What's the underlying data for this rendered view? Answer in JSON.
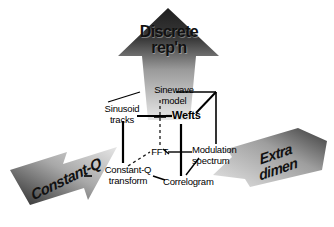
{
  "figure": {
    "background_color": "#ffffff",
    "title_arrow_up": {
      "label": "Discrete\nrep'n",
      "direction": "up",
      "gradient_dark": "#262626",
      "gradient_light": "#e2e2e2"
    },
    "arrow_left": {
      "label": "Constant-Q",
      "direction": "down-left",
      "gradient_dark": "#2b2b2b",
      "gradient_light": "#dadada"
    },
    "arrow_right": {
      "label": "Extra\ndimen",
      "direction": "down-left",
      "gradient_dark": "#2f2f2f",
      "gradient_light": "#dcdcdc"
    }
  },
  "nodes": [
    {
      "id": "sinewave-model",
      "label": "Sinewave\nmodel",
      "bold": false,
      "x": 141,
      "y": 85,
      "w": 66
    },
    {
      "id": "sinusoid-tracks",
      "label": "Sinusoid\ntracks",
      "bold": false,
      "x": 91,
      "y": 104,
      "w": 62
    },
    {
      "id": "wefts",
      "label": "Wefts",
      "bold": true,
      "x": 172,
      "y": 116,
      "w": 48
    },
    {
      "id": "fft",
      "label": "FFT",
      "bold": false,
      "x": 147,
      "y": 149,
      "w": 28
    },
    {
      "id": "modulation-spectrum",
      "label": "Modulation\nspectrum",
      "bold": false,
      "x": 194,
      "y": 146,
      "w": 68
    },
    {
      "id": "constant-q-transform",
      "label": "Constant-Q\ntransform",
      "bold": false,
      "x": 93,
      "y": 168,
      "w": 74
    },
    {
      "id": "correlogram",
      "label": "Correlogram",
      "bold": false,
      "x": 163,
      "y": 179,
      "w": 66
    }
  ],
  "edges": [
    {
      "from": "sinusoid-tracks",
      "to": "sinewave-model",
      "style": "solid"
    },
    {
      "from": "wefts",
      "to": "sinewave-model",
      "style": "solid"
    },
    {
      "from": "sinewave-model",
      "to": "fft",
      "style": "dashed"
    },
    {
      "from": "sinusoid-tracks",
      "to": "wefts",
      "style": "solid"
    },
    {
      "from": "sinusoid-tracks",
      "to": "constant-q-transform",
      "style": "solid"
    },
    {
      "from": "constant-q-transform",
      "to": "fft",
      "style": "dashed"
    },
    {
      "from": "fft",
      "to": "modulation-spectrum",
      "style": "solid"
    },
    {
      "from": "wefts",
      "to": "correlogram",
      "style": "solid"
    },
    {
      "from": "correlogram",
      "to": "modulation-spectrum",
      "style": "solid"
    },
    {
      "from": "constant-q-transform",
      "to": "correlogram",
      "style": "solid"
    },
    {
      "from": "modulation-spectrum",
      "to": "sinewave-model",
      "style": "solid"
    }
  ]
}
